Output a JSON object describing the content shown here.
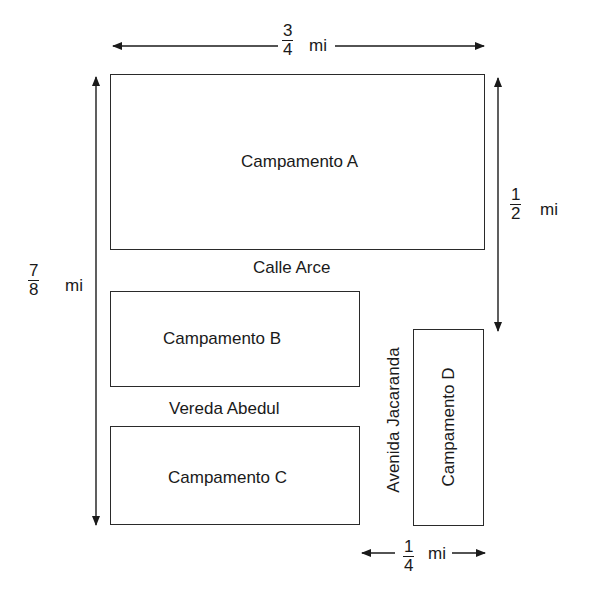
{
  "diagram": {
    "camps": {
      "a": "Campamento A",
      "b": "Campamento B",
      "c": "Campamento C",
      "d": "Campamento D"
    },
    "streets": {
      "calle_arce": "Calle Arce",
      "vereda_abedul": "Vereda Abedul",
      "avenida_jacaranda": "Avenida Jacaranda"
    },
    "dimensions": {
      "top": {
        "numerator": "3",
        "denominator": "4",
        "unit": "mi"
      },
      "left": {
        "numerator": "7",
        "denominator": "8",
        "unit": "mi"
      },
      "right": {
        "numerator": "1",
        "denominator": "2",
        "unit": "mi"
      },
      "bottom": {
        "numerator": "1",
        "denominator": "4",
        "unit": "mi"
      }
    },
    "colors": {
      "line": "#2a2a2a",
      "background": "#ffffff"
    }
  }
}
